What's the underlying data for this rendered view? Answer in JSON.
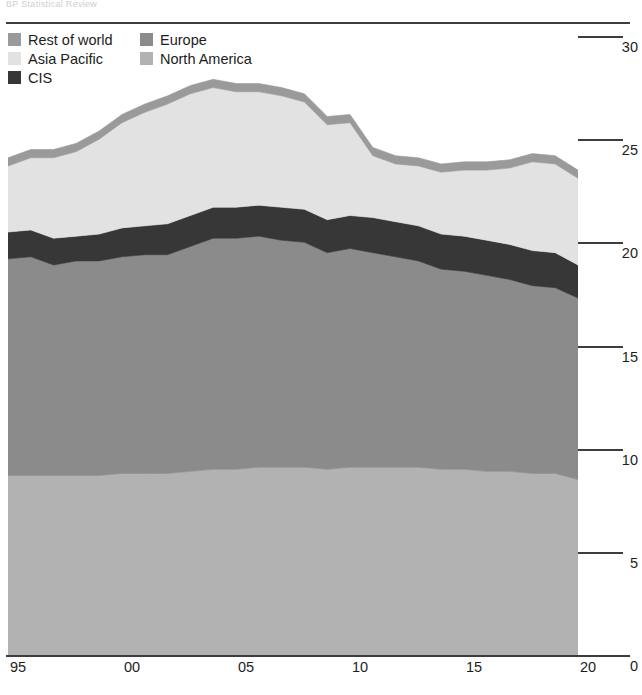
{
  "header": {
    "cropped_caption": "BP Statistical Review"
  },
  "legend": {
    "items": [
      {
        "label": "Rest of world",
        "color": "#9a9a9a",
        "key": "rest_of_world"
      },
      {
        "label": "Europe",
        "color": "#8b8b8b",
        "key": "europe"
      },
      {
        "label": "Asia Pacific",
        "color": "#e2e2e2",
        "key": "asia_pacific"
      },
      {
        "label": "North America",
        "color": "#b2b2b2",
        "key": "north_america"
      },
      {
        "label": "CIS",
        "color": "#373737",
        "key": "cis"
      }
    ]
  },
  "axes": {
    "y_ticks": [
      "0",
      "5",
      "10",
      "15",
      "20",
      "25",
      "30"
    ],
    "x_ticks": [
      "95",
      "00",
      "05",
      "10",
      "15",
      "20"
    ]
  },
  "chart_data": {
    "type": "area",
    "stacked": true,
    "title": "",
    "subtitle": "",
    "xlabel": "",
    "ylabel": "",
    "xlim": [
      1995,
      2020
    ],
    "ylim": [
      0,
      30
    ],
    "ytick_values": [
      0,
      5,
      10,
      15,
      20,
      25,
      30
    ],
    "xtick_values": [
      1995,
      2000,
      2005,
      2010,
      2015,
      2020
    ],
    "xtick_labels": [
      "95",
      "00",
      "05",
      "10",
      "15",
      "20"
    ],
    "y_axis_position": "right",
    "grid": false,
    "legend_position": "top-left",
    "x": [
      1995,
      1996,
      1997,
      1998,
      1999,
      2000,
      2001,
      2002,
      2003,
      2004,
      2005,
      2006,
      2007,
      2008,
      2009,
      2010,
      2011,
      2012,
      2013,
      2014,
      2015,
      2016,
      2017,
      2018,
      2019,
      2020
    ],
    "series": [
      {
        "name": "North America",
        "color": "#b2b2b2",
        "values": [
          8.7,
          8.7,
          8.7,
          8.7,
          8.7,
          8.8,
          8.8,
          8.8,
          8.9,
          9.0,
          9.0,
          9.1,
          9.1,
          9.1,
          9.0,
          9.1,
          9.1,
          9.1,
          9.1,
          9.0,
          9.0,
          8.9,
          8.9,
          8.8,
          8.8,
          8.5
        ]
      },
      {
        "name": "Europe",
        "color": "#8b8b8b",
        "values": [
          10.5,
          10.6,
          10.2,
          10.4,
          10.4,
          10.5,
          10.6,
          10.6,
          10.9,
          11.2,
          11.2,
          11.2,
          11.0,
          10.9,
          10.5,
          10.6,
          10.4,
          10.2,
          10.0,
          9.7,
          9.6,
          9.5,
          9.3,
          9.1,
          9.0,
          8.8
        ]
      },
      {
        "name": "CIS",
        "color": "#373737",
        "values": [
          1.3,
          1.3,
          1.3,
          1.2,
          1.3,
          1.4,
          1.4,
          1.5,
          1.5,
          1.5,
          1.5,
          1.5,
          1.6,
          1.6,
          1.6,
          1.6,
          1.7,
          1.7,
          1.7,
          1.7,
          1.7,
          1.7,
          1.7,
          1.7,
          1.7,
          1.6
        ]
      },
      {
        "name": "Asia Pacific",
        "color": "#e2e2e2",
        "values": [
          3.2,
          3.5,
          3.9,
          4.1,
          4.6,
          5.1,
          5.5,
          5.8,
          5.9,
          5.8,
          5.6,
          5.5,
          5.4,
          5.2,
          4.6,
          4.5,
          3.0,
          2.8,
          2.9,
          3.0,
          3.2,
          3.4,
          3.7,
          4.3,
          4.3,
          4.2
        ]
      },
      {
        "name": "Rest of world",
        "color": "#9a9a9a",
        "values": [
          0.4,
          0.4,
          0.4,
          0.4,
          0.4,
          0.4,
          0.4,
          0.4,
          0.4,
          0.4,
          0.4,
          0.4,
          0.4,
          0.4,
          0.4,
          0.4,
          0.4,
          0.4,
          0.4,
          0.4,
          0.4,
          0.4,
          0.4,
          0.4,
          0.4,
          0.4
        ]
      }
    ],
    "totals": [
      24.1,
      24.5,
      24.5,
      24.8,
      25.3,
      26.2,
      26.7,
      27.1,
      27.6,
      27.9,
      27.7,
      27.7,
      27.5,
      27.2,
      26.1,
      26.2,
      24.6,
      24.2,
      24.1,
      23.8,
      23.9,
      23.9,
      24.0,
      24.3,
      24.2,
      23.5
    ]
  }
}
